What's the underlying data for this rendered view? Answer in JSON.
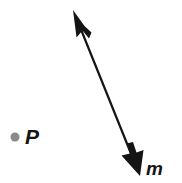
{
  "figure": {
    "type": "geometry-diagram",
    "background_color": "#ffffff",
    "width": 182,
    "height": 183
  },
  "point": {
    "name": "point-p",
    "label": "P",
    "dot_color": "#8a8a8a",
    "dot_radius": 4.5,
    "center_x": 15,
    "center_y": 137,
    "label_x": 25,
    "label_y": 126
  },
  "line": {
    "name": "line-m",
    "label": "m",
    "stroke_color": "#141414",
    "stroke_width": 2,
    "arrow_color": "#141414",
    "start_x": 73,
    "start_y": 10,
    "end_x": 140,
    "end_y": 176,
    "arrowheads": "both",
    "label_x": 146,
    "label_y": 159
  }
}
